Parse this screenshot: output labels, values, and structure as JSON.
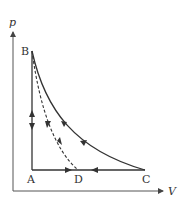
{
  "diagram": {
    "axes": {
      "y_label": "p",
      "x_label": "V"
    },
    "points": {
      "A": "A",
      "B": "B",
      "C": "C",
      "D": "D"
    },
    "processes": [
      {
        "name": "A-B",
        "style": "solid",
        "description": "vertical line, arrows both up and down"
      },
      {
        "name": "B-C",
        "style": "solid curve",
        "description": "curve from B to C, arrows pointing toward B"
      },
      {
        "name": "B-D",
        "style": "dashed curve",
        "description": "dashed curve from B to D, arrows pointing toward B"
      },
      {
        "name": "C-D",
        "style": "solid",
        "description": "horizontal, arrow pointing toward D"
      },
      {
        "name": "A-D",
        "style": "solid",
        "description": "horizontal, arrow pointing toward D"
      }
    ],
    "colors": {
      "line": "#333333",
      "background": "#ffffff"
    }
  }
}
